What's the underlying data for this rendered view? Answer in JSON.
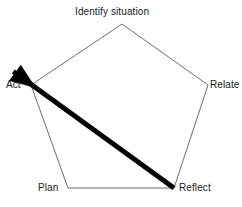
{
  "diagram": {
    "type": "pentagon-cycle",
    "shape": {
      "name": "pentagon",
      "stroke_color": "#6b6b6b",
      "fill_color": "#ffffff",
      "stroke_width": 1,
      "vertices": [
        {
          "id": "identify",
          "x": 122,
          "y": 24
        },
        {
          "id": "relate",
          "x": 208,
          "y": 85
        },
        {
          "id": "reflect",
          "x": 174,
          "y": 188
        },
        {
          "id": "plan",
          "x": 68,
          "y": 188
        },
        {
          "id": "act",
          "x": 31,
          "y": 85
        }
      ]
    },
    "labels": {
      "identify": "Identify situation",
      "relate": "Relate",
      "reflect": "Reflect",
      "plan": "Plan",
      "act": "Act"
    },
    "arrow": {
      "name": "reflect-to-act-arrow",
      "color": "#000000",
      "from": "reflect",
      "to": "act",
      "start_x": 174,
      "start_y": 188,
      "end_x": 36,
      "end_y": 88,
      "shaft_width": 5,
      "head_length": 26,
      "head_width": 20
    }
  }
}
